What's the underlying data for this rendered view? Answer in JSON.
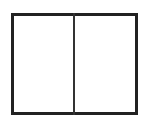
{
  "diagram": {
    "shape": "rectangle-split-vertical",
    "panels": 2,
    "border_color": "#222222",
    "divider_color": "#333333"
  }
}
